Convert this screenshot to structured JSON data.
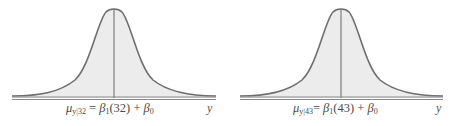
{
  "figure": {
    "panels": [
      {
        "id": "left",
        "x_value": "32",
        "mean_symbol": "μ",
        "mean_subscript": "y|32",
        "equals": "=",
        "beta1": "β",
        "beta1_sub": "1",
        "arg": "(32)",
        "plus": "+",
        "beta0": "β",
        "beta0_sub": "0",
        "axis_label": "y"
      },
      {
        "id": "right",
        "x_value": "43",
        "mean_symbol": "μ",
        "mean_subscript": "y|43",
        "equals": "=",
        "beta1": "β",
        "beta1_sub": "1",
        "arg": "(43)",
        "plus": "+",
        "beta0": "β",
        "beta0_sub": "0",
        "axis_label": "y"
      }
    ],
    "colors": {
      "curve": "#6e6e6e",
      "fill": "#ececec",
      "axis": "#777777",
      "text": "#4a4a4a"
    }
  }
}
